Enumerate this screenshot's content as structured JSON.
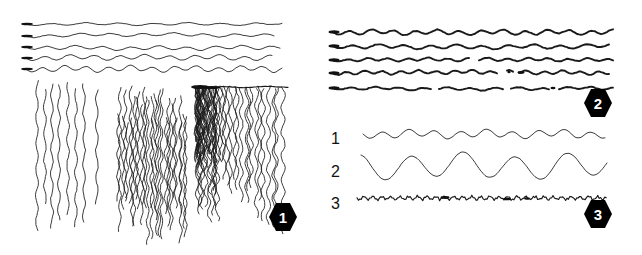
{
  "figure": {
    "width": 642,
    "height": 255,
    "background_color": "#ffffff",
    "ink_color": "#1a1a1a",
    "badge_color": "#000000",
    "badge_text_color": "#ffffff"
  },
  "panels": [
    {
      "id": "panel-1",
      "badge_label": "1",
      "groups": [
        {
          "name": "horizontal-wavy-lines",
          "count": 5,
          "orientation": "horizontal",
          "has_start_blob": true,
          "stroke_weight": "thin"
        },
        {
          "name": "sparse-vertical-strokes",
          "count": 8,
          "orientation": "vertical",
          "density": "sparse",
          "stroke_weight": "thin"
        },
        {
          "name": "dense-vertical-strokes",
          "count": 26,
          "orientation": "vertical",
          "density": "dense",
          "stroke_weight": "thin"
        },
        {
          "name": "vertical-strokes-with-top-bar",
          "count": 30,
          "orientation": "vertical",
          "density": "very-dense-left",
          "has_top_bar": true,
          "stroke_weight": "thin"
        }
      ]
    },
    {
      "id": "panel-2",
      "badge_label": "2",
      "groups": [
        {
          "name": "thick-horizontal-wavy-lines",
          "count": 5,
          "orientation": "horizontal",
          "has_start_blob": true,
          "has_gaps": true,
          "stroke_weight": "thick"
        }
      ]
    },
    {
      "id": "panel-3",
      "badge_label": "3",
      "rows": [
        {
          "label": "1",
          "name": "regular-small-amplitude-wave",
          "amplitude": 4,
          "wavelength": 26,
          "stroke_weight": "thin"
        },
        {
          "label": "2",
          "name": "large-amplitude-long-wave",
          "amplitude": 12,
          "wavelength": 52,
          "stroke_weight": "thin"
        },
        {
          "label": "3",
          "name": "high-frequency-jitter-line",
          "amplitude": 2,
          "wavelength": 9,
          "stroke_weight": "medium"
        }
      ]
    }
  ]
}
